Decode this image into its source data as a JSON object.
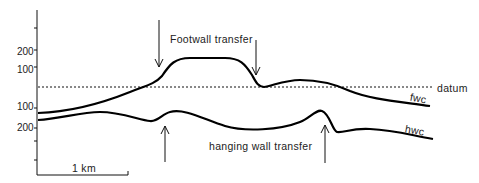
{
  "diagram": {
    "type": "cross-section",
    "labels": {
      "footwall_transfer": "Footwall transfer",
      "hanging_wall_transfer": "hanging wall transfer",
      "datum": "datum",
      "fwc": "fwc",
      "hwc": "hwc",
      "scale_bar": "1 km"
    },
    "y_axis": {
      "upper_ticks": [
        "200",
        "100"
      ],
      "lower_ticks": [
        "100",
        "200"
      ]
    },
    "colors": {
      "line": "#000000",
      "text": "#222222",
      "background": "#ffffff"
    }
  }
}
